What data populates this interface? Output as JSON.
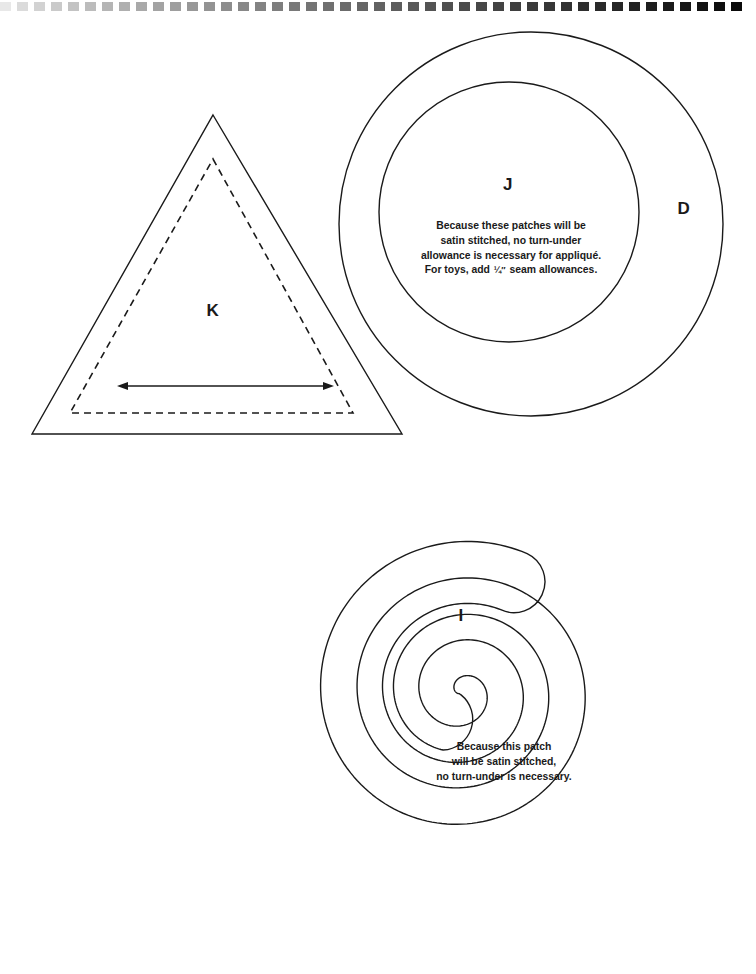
{
  "page": {
    "width": 756,
    "height": 974,
    "background": "#ffffff",
    "ink": "#1a1a1a",
    "document_type": "sewing-pattern-template-sheet"
  },
  "scan_edge": {
    "name": "scan-artifact-strip",
    "description": "dashed black-and-white checkered scan edge along top of page",
    "dash_count": 44,
    "dash_width": 11,
    "dash_gap": 6,
    "height": 9,
    "top": 2,
    "color": "#000000"
  },
  "pieces": [
    {
      "id": "K",
      "name": "triangle-piece-k",
      "shape": "triangle",
      "label": "K",
      "label_x": 213,
      "label_y": 311,
      "label_size": 17,
      "outline": {
        "apex_x": 213,
        "apex_y": 115,
        "left_x": 32,
        "left_y": 434,
        "right_x": 402,
        "right_y": 434,
        "stroke": "#1a1a1a",
        "stroke_width": 1.4
      },
      "seam_line": {
        "style": "dashed",
        "apex_x": 213,
        "apex_y": 159,
        "left_x": 70,
        "left_y": 413,
        "right_x": 353,
        "right_y": 413,
        "dash": "7 5",
        "stroke_width": 1.6
      },
      "grainline": {
        "name": "grainline-arrow",
        "x1": 117,
        "y1": 386,
        "x2": 334,
        "y2": 386,
        "stroke_width": 1.4,
        "double_headed": true
      }
    },
    {
      "id": "D",
      "name": "circle-piece-d",
      "shape": "circle",
      "label": "D",
      "label_x": 684,
      "label_y": 209,
      "label_size": 17,
      "cx": 531,
      "cy": 224,
      "r": 192,
      "stroke": "#1a1a1a",
      "stroke_width": 1.4
    },
    {
      "id": "J",
      "name": "circle-piece-j",
      "shape": "circle",
      "label": "J",
      "label_x": 508,
      "label_y": 185,
      "label_size": 17,
      "cx": 509,
      "cy": 212,
      "r": 130,
      "stroke": "#1a1a1a",
      "stroke_width": 1.4
    },
    {
      "id": "I",
      "name": "spiral-piece-i",
      "shape": "spiral",
      "label": "I",
      "label_x": 461,
      "label_y": 616,
      "label_size": 17,
      "cx": 462,
      "cy": 692,
      "turns": 2,
      "stroke": "#1a1a1a",
      "stroke_width": 1.4
    }
  ],
  "notes": [
    {
      "name": "appliqué-note",
      "piece": "J",
      "x": 511,
      "y": 219,
      "font_size": 10.4,
      "lines": [
        "Because these patches will be",
        "satin stitched, no turn-under",
        "allowance is necessary for appliqué.",
        "For toys, add ¼″ seam allowances."
      ],
      "fraction_line_index": 3,
      "fraction_text": "¼″",
      "line_before_fraction": "For toys, add ",
      "line_after_fraction": " seam allowances."
    },
    {
      "name": "satin-stitch-note",
      "piece": "I",
      "x": 504,
      "y": 740,
      "font_size": 10.4,
      "lines": [
        "Because this patch",
        "will be satin stitched,",
        "no turn-under is necessary."
      ]
    }
  ]
}
